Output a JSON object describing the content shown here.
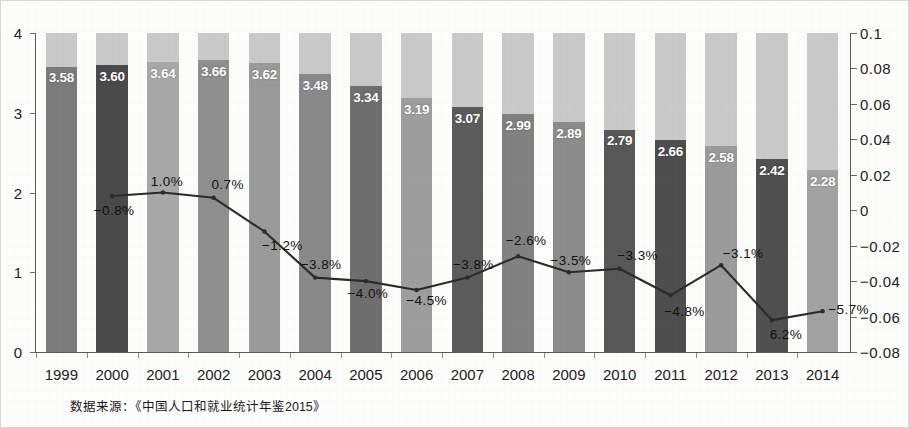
{
  "chart_data": {
    "type": "bar",
    "title": "",
    "subtitle": "",
    "xlabel": "",
    "ylabel_left": "",
    "ylabel_right": "",
    "grid": false,
    "legend_position": "none",
    "categories": [
      "1999",
      "2000",
      "2001",
      "2002",
      "2003",
      "2004",
      "2005",
      "2006",
      "2007",
      "2008",
      "2009",
      "2010",
      "2011",
      "2012",
      "2013",
      "2014"
    ],
    "series": [
      {
        "name": "bar_value",
        "axis": "left",
        "type": "bar",
        "values": [
          3.58,
          3.6,
          3.64,
          3.66,
          3.62,
          3.48,
          3.34,
          3.19,
          3.07,
          2.99,
          2.89,
          2.79,
          2.66,
          2.58,
          2.42,
          2.28
        ],
        "labels": [
          "3.58",
          "3.60",
          "3.64",
          "3.66",
          "3.62",
          "3.48",
          "3.34",
          "3.19",
          "3.07",
          "2.99",
          "2.89",
          "2.79",
          "2.66",
          "2.58",
          "2.42",
          "2.28"
        ]
      },
      {
        "name": "growth_rate",
        "axis": "right",
        "type": "line",
        "x": [
          "2000",
          "2001",
          "2002",
          "2003",
          "2004",
          "2005",
          "2006",
          "2007",
          "2008",
          "2009",
          "2010",
          "2011",
          "2012",
          "2013",
          "2014"
        ],
        "values": [
          0.008,
          0.01,
          0.007,
          -0.012,
          -0.038,
          -0.04,
          -0.045,
          -0.038,
          -0.026,
          -0.035,
          -0.033,
          -0.048,
          -0.031,
          -0.062,
          -0.057
        ],
        "labels": [
          "-0.8%",
          "1.0%",
          "0.7%",
          "-1.2%",
          "-3.8%",
          "-4.0%",
          "-4.5%",
          "-3.8%",
          "-2.6%",
          "-3.5%",
          "-3.3%",
          "-4.8%",
          "-3.1%",
          "6.2%",
          "-5.7%"
        ]
      }
    ],
    "ylim_left": [
      0,
      4
    ],
    "ylim_right": [
      -0.08,
      0.1
    ],
    "yticks_left": [
      "0",
      "1",
      "2",
      "3",
      "4"
    ],
    "yticks_right": [
      "-0.08",
      "-0.06",
      "-0.04",
      "-0.02",
      "0",
      "0.02",
      "0.04",
      "0.06",
      "0.08",
      "0.1"
    ],
    "bar_colors": [
      "#7c7c7c",
      "#4a4a4a",
      "#a8a8a8",
      "#8f8f8f",
      "#9a9a9a",
      "#8a8a8a",
      "#6f6f6f",
      "#9e9e9e",
      "#5c5c5c",
      "#818181",
      "#8c8c8c",
      "#585858",
      "#4e4e4e",
      "#9b9b9b",
      "#505050",
      "#a2a2a2"
    ],
    "bar_background_color": "#c9c9c9",
    "line_color": "#2b2b2b"
  },
  "source": {
    "note": "数据来源：《中国人口和就业统计年鉴2015》"
  }
}
